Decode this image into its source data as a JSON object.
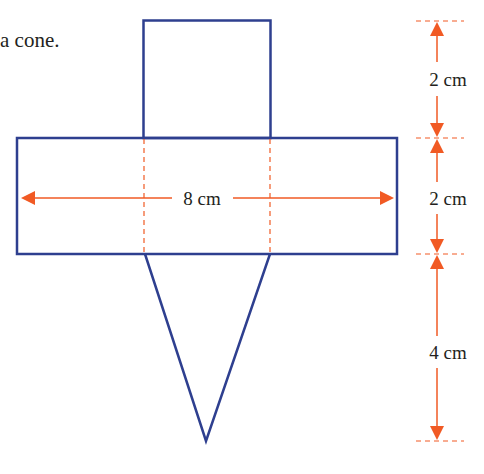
{
  "caption": "a cone.",
  "labels": {
    "width": "8 cm",
    "top_height": "2 cm",
    "middle_height": "2 cm",
    "bottom_height": "4 cm"
  },
  "colors": {
    "outline": "#2e3f8f",
    "dimension": "#f15a24",
    "text": "#231f20"
  }
}
